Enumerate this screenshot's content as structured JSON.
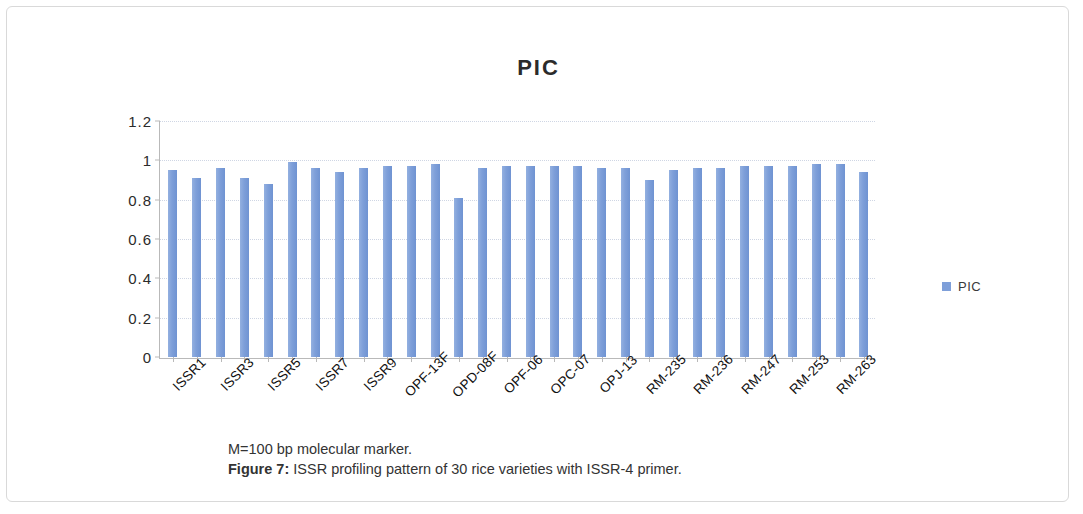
{
  "figure": {
    "title": "PIC",
    "caption_line1": "M=100 bp molecular marker.",
    "caption_figure_number": "Figure 7:",
    "caption_line2": " ISSR profiling pattern of 30 rice varieties with ISSR-4 primer."
  },
  "legend": {
    "position": "right",
    "entries": [
      {
        "label": "PIC",
        "color": "#7E9FD9"
      }
    ]
  },
  "colors": {
    "bar": "#7E9FD9",
    "gridline": "#cfd6e4",
    "axis": "#b9b9b9",
    "frame_border": "#d9d9d9",
    "title_text": "#2b2b2b",
    "caption_text": "#333333"
  },
  "chart_data": {
    "type": "bar",
    "title": "PIC",
    "xlabel": "",
    "ylabel": "",
    "ylim": [
      0,
      1.2
    ],
    "yticks": [
      0,
      0.2,
      0.4,
      0.6,
      0.8,
      1,
      1.2
    ],
    "ytick_labels": [
      "0",
      "0.2",
      "0.4",
      "0.6",
      "0.8",
      "1",
      "1.2"
    ],
    "grid": true,
    "legend": [
      "PIC"
    ],
    "series_name": "PIC",
    "x_tick_labels_every_nth": 2,
    "visible_tick_labels": [
      "ISSR1",
      "ISSR3",
      "ISSR5",
      "ISSR7",
      "ISSR9",
      "OPF-13F",
      "OPD-08F",
      "OPF-06",
      "OPC-07",
      "OPJ-13",
      "RM-235",
      "RM-236",
      "RM-247",
      "RM-253",
      "RM-263"
    ],
    "categories": [
      "ISSR1",
      "ISSR2",
      "ISSR3",
      "ISSR4",
      "ISSR5",
      "ISSR6",
      "ISSR7",
      "ISSR8",
      "ISSR9",
      "ISSR10",
      "OPF-13F",
      "OPF-14F",
      "OPD-08F",
      "OPD-09F",
      "OPF-06",
      "OPF-07",
      "OPC-07",
      "OPC-08",
      "OPJ-13",
      "OPJ-14",
      "RM-235",
      "RM-235B",
      "RM-236",
      "RM-236B",
      "RM-247",
      "RM-247B",
      "RM-253",
      "RM-253B",
      "RM-263",
      "RM-263B"
    ],
    "values": [
      0.95,
      0.91,
      0.96,
      0.91,
      0.88,
      0.99,
      0.96,
      0.94,
      0.96,
      0.97,
      0.97,
      0.98,
      0.81,
      0.96,
      0.97,
      0.97,
      0.97,
      0.97,
      0.96,
      0.96,
      0.9,
      0.95,
      0.96,
      0.96,
      0.97,
      0.97,
      0.97,
      0.98,
      0.98,
      0.94
    ]
  }
}
